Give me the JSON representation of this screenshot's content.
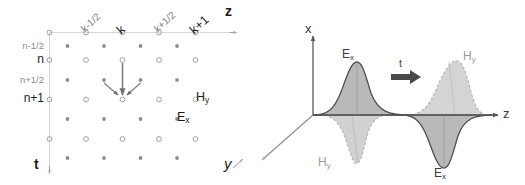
{
  "left_panel": {
    "name": "fdtd-space-time-grid",
    "axis_z_label": "z",
    "axis_t_label": "t",
    "axis_y_label": "y",
    "column_labels": [
      "k-1/2",
      "k",
      "k+1/2",
      "k+1"
    ],
    "row_labels": [
      "n-1/2",
      "n",
      "n+1/2",
      "n+1"
    ],
    "field_label_e": "E",
    "field_label_e_sub": "x",
    "field_label_h": "H",
    "field_label_h_sub": "y",
    "node_open_meaning": "E-field node",
    "node_filled_meaning": "H-field node",
    "colors": {
      "grid_line": "#d8d8d8",
      "node_open_stroke": "#9a9a9a",
      "node_filled": "#8f8f8f",
      "arrow": "#6e6e6e",
      "text_major": "#1d1d1d",
      "text_minor": "#8a8a8a"
    }
  },
  "right_panel": {
    "name": "pulse-propagation-3d",
    "axis_x_label": "x",
    "axis_z_label": "z",
    "axis_y_label": "y",
    "time_arrow_label": "t",
    "pulse_1": {
      "upper_label": "E",
      "upper_label_sub": "x",
      "lower_label": "H",
      "lower_label_sub": "y"
    },
    "pulse_2": {
      "upper_label": "H",
      "upper_label_sub": "y",
      "lower_label": "E",
      "lower_label_sub": "x"
    },
    "colors": {
      "axis": "#555555",
      "fill_dark": "#b2b2b2",
      "fill_light": "#cdcdcd",
      "outline_solid": "#4a4a4a",
      "outline_dashed": "#a8a8a8"
    }
  }
}
